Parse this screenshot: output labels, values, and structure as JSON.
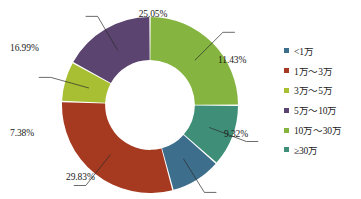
{
  "chart_data": {
    "type": "pie",
    "variant": "donut",
    "title": "",
    "subtitle": "",
    "xlabel": "",
    "ylabel": "",
    "grid": false,
    "legend_position": "right",
    "donut_inner_ratio": 0.51,
    "start_angle_deg": -90,
    "direction": "clockwise",
    "categories": [
      "<1万",
      "1万～3万",
      "3万～5万",
      "5万～10万",
      "10万～30万",
      "≥30万"
    ],
    "values": [
      9.32,
      29.83,
      7.38,
      16.99,
      25.05,
      11.43
    ],
    "value_labels": [
      "9.32%",
      "29.83%",
      "7.38%",
      "16.99%",
      "25.05%",
      "11.43%"
    ],
    "colors": [
      "#3d6e8c",
      "#a63a20",
      "#a8bf33",
      "#5b4470",
      "#86b440",
      "#3f8f78"
    ],
    "unit": "%",
    "slice_order_clockwise": [
      "10万～30万",
      "≥30万",
      "<1万",
      "1万～3万",
      "3万～5万",
      "5万～10万"
    ],
    "labels": [
      {
        "text": "25.05%",
        "x": 153,
        "y": 9,
        "anchor": "middle"
      },
      {
        "text": "11.43%",
        "x": 218,
        "y": 55,
        "anchor": "start"
      },
      {
        "text": "9.32%",
        "x": 224,
        "y": 129,
        "anchor": "start"
      },
      {
        "text": "29.83%",
        "x": 66,
        "y": 172,
        "anchor": "start"
      },
      {
        "text": "7.38%",
        "x": 10,
        "y": 128,
        "anchor": "start"
      },
      {
        "text": "16.99%",
        "x": 10,
        "y": 43,
        "anchor": "start"
      }
    ]
  },
  "legend": {
    "items": [
      {
        "label": "<1万",
        "color": "#3d6e8c"
      },
      {
        "label": "1万～3万",
        "color": "#a63a20"
      },
      {
        "label": "3万～5万",
        "color": "#a8bf33"
      },
      {
        "label": "5万～10万",
        "color": "#5b4470"
      },
      {
        "label": "10万～30万",
        "color": "#86b440"
      },
      {
        "label": "≥30万",
        "color": "#3f8f78"
      }
    ]
  }
}
